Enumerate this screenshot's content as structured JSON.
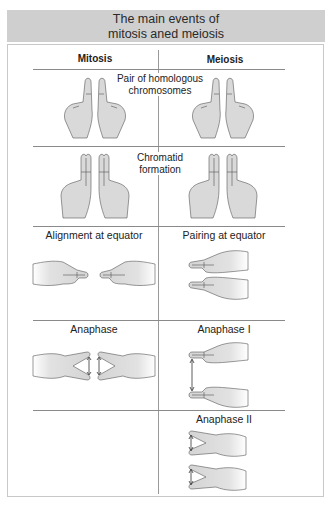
{
  "title": {
    "line1": "The main events of",
    "line2": "mitosis aned meiosis"
  },
  "columns": {
    "left": "Mitosis",
    "right": "Meiosis"
  },
  "rows": [
    {
      "shared_label_line1": "Pair of homologous",
      "shared_label_line2": "chromosomes",
      "mitosis_illustration": "two-raised-index-fingers",
      "meiosis_illustration": "two-raised-index-fingers"
    },
    {
      "shared_label_line1": "Chromatid",
      "shared_label_line2": "formation",
      "mitosis_illustration": "two-raised-double-fingers",
      "meiosis_illustration": "two-raised-double-fingers"
    },
    {
      "mitosis_label": "Alignment at equator",
      "meiosis_label": "Pairing at equator",
      "mitosis_illustration": "hands-pointing-toward-each-other",
      "meiosis_illustration": "hands-stacked-paired"
    },
    {
      "mitosis_label": "Anaphase",
      "meiosis_label": "Anaphase I",
      "mitosis_illustration": "hands-split-v-fingers",
      "meiosis_illustration": "hands-stacked-separating"
    },
    {
      "mitosis_label": "",
      "meiosis_label": "Anaphase II",
      "meiosis_illustration": "v-fingers-splitting"
    }
  ],
  "colors": {
    "title_band": "#cfcfcf",
    "hand_fill": "#d9d9d9",
    "rule": "#8a8a8a"
  }
}
